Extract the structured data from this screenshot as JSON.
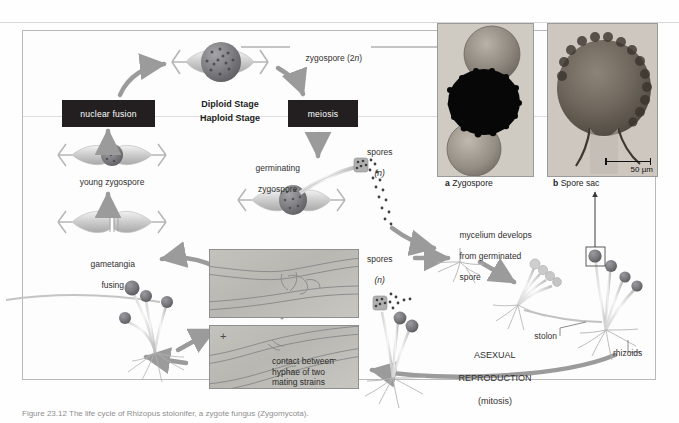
{
  "figure": {
    "organism": "Rhizopus (black bread mold) life cycle",
    "caption_clipped": "Figure 23.12  The life cycle of Rhizopus stolonifer, a zygote fungus (Zygomycota)."
  },
  "stages": {
    "diploid_label": "Diploid Stage",
    "haploid_label": "Haploid Stage"
  },
  "boxes": {
    "nuclear_fusion": "nuclear fusion",
    "meiosis": "meiosis"
  },
  "labels": {
    "zygospore_2n": "zygospore (2",
    "zygospore_2n_italic": "n",
    "zygospore_2n_close": ")",
    "young_zygospore": "young zygospore",
    "gametangia_fusing_line1": "gametangia",
    "gametangia_fusing_line2": "fusing",
    "germinating_line1": "germinating",
    "germinating_line2": "zygospore",
    "spores_upper_line1": "spores",
    "spores_upper_line2": "(n)",
    "spores_lower_line1": "spores",
    "spores_lower_line2": "(n)",
    "mycelium_line1": "mycelium develops",
    "mycelium_line2": "from germinated",
    "mycelium_line3": "spore",
    "stolon": "stolon",
    "rhizoids": "rhizoids",
    "asexual_line1": "ASEXUAL",
    "asexual_line2": "REPRODUCTION",
    "asexual_line3": "(mitosis)"
  },
  "micrographs": {
    "hyphae_contact_line1": "contact between",
    "hyphae_contact_line2": "hyphae of two",
    "hyphae_contact_line3": "mating strains",
    "plus_strain": "+",
    "minus_strain": "–"
  },
  "photos": [
    {
      "id": "a",
      "letter": "a",
      "title": "Zygospore",
      "scale": null
    },
    {
      "id": "b",
      "letter": "b",
      "title": "Spore sac",
      "scale": "50 µm"
    }
  ],
  "colors": {
    "box_fill": "#231f20",
    "box_text": "#ffffff",
    "arrow_gray": "#9b9b9b",
    "frame_border": "#b9b9b9",
    "text": "#2b2b2b",
    "spore_head": "#6f6f72",
    "background": "#fefefe"
  }
}
